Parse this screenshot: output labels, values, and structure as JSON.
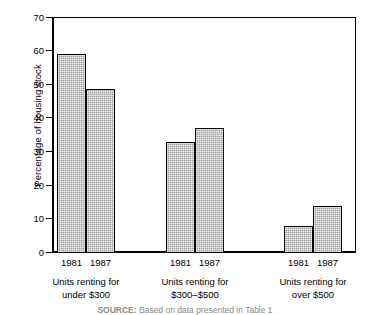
{
  "chart_data": {
    "type": "bar",
    "title": "",
    "subtitle": "",
    "xlabel": "",
    "ylabel": "Percentage of housing stock",
    "ylim": [
      0,
      70
    ],
    "yticks": [
      0,
      10,
      20,
      30,
      40,
      50,
      60,
      70
    ],
    "ytick_labels": [
      "0",
      "10",
      "20",
      "30",
      "40",
      "50",
      "60",
      "70"
    ],
    "grid": false,
    "legend": false,
    "legend_position": "none",
    "categories": [
      "Units renting for under $300",
      "Units renting for $300–$500",
      "Units renting for over $500"
    ],
    "series": [
      {
        "name": "1981",
        "values": [
          59,
          33,
          8
        ]
      },
      {
        "name": "1987",
        "values": [
          48.5,
          37,
          14
        ]
      }
    ],
    "bar_fill_color": "#9e9e9e",
    "bar_edge_color": "#000000",
    "axis_color": "#000000",
    "background_color": "#ffffff"
  },
  "axis": {
    "y_title": "Percentage of housing stock",
    "ticks": [
      {
        "value": 70,
        "label": "70"
      },
      {
        "value": 60,
        "label": "60"
      },
      {
        "value": 50,
        "label": "50"
      },
      {
        "value": 40,
        "label": "40"
      },
      {
        "value": 30,
        "label": "30"
      },
      {
        "value": 20,
        "label": "20"
      },
      {
        "value": 10,
        "label": "10"
      },
      {
        "value": 0,
        "label": "0"
      }
    ]
  },
  "groups": [
    {
      "caption_line1": "Units renting for",
      "caption_line2": "under $300",
      "bars": [
        {
          "year": "1981",
          "value": 59
        },
        {
          "year": "1987",
          "value": 48.5
        }
      ]
    },
    {
      "caption_line1": "Units renting for",
      "caption_line2": "$300–$500",
      "bars": [
        {
          "year": "1981",
          "value": 33
        },
        {
          "year": "1987",
          "value": 37
        }
      ]
    },
    {
      "caption_line1": "Units renting for",
      "caption_line2": "over $500",
      "bars": [
        {
          "year": "1981",
          "value": 8
        },
        {
          "year": "1987",
          "value": 14
        }
      ]
    }
  ],
  "source": {
    "prefix": "SOURCE:",
    "text": " Based on data presented in Table 1"
  }
}
